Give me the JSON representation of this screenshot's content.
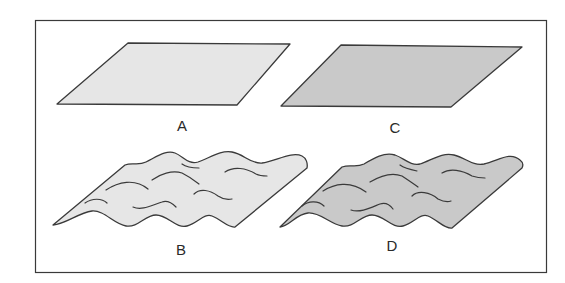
{
  "figure": {
    "frame": true,
    "colors": {
      "stroke": "#3a3a3a",
      "light_fill": "#e6e6e6",
      "dark_fill": "#c9c9c9",
      "background": "#ffffff"
    },
    "panels": [
      {
        "id": "A",
        "label": "A",
        "shape": "flat parallelogram",
        "fill": "light"
      },
      {
        "id": "C",
        "label": "C",
        "shape": "flat parallelogram",
        "fill": "dark"
      },
      {
        "id": "B",
        "label": "B",
        "shape": "wavy surface",
        "fill": "light"
      },
      {
        "id": "D",
        "label": "D",
        "shape": "wavy surface",
        "fill": "dark"
      }
    ]
  }
}
